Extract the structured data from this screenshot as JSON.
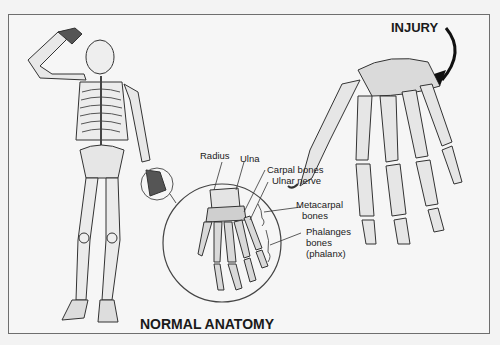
{
  "diagram": {
    "title_normal": "NORMAL ANATOMY",
    "title_injury": "INJURY",
    "labels": {
      "radius": "Radius",
      "ulna": "Ulna",
      "carpal": "Carpal bones",
      "ulnar_nerve": "Ulnar nerve",
      "metacarpal_1": "Metacarpal",
      "metacarpal_2": "bones",
      "phalanges_1": "Phalanges",
      "phalanges_2": "bones",
      "phalanges_3": "(phalanx)"
    },
    "colors": {
      "background": "#f3f3f3",
      "frame": "#6e6e6e",
      "ink": "#1a1a1a",
      "bone_fill": "#e4e4e4"
    }
  }
}
